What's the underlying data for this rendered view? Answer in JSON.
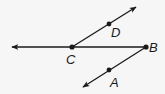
{
  "diagram": {
    "type": "geometry-rays",
    "stroke_color": "#1a1a1a",
    "background": "#f6f6f6",
    "points": [
      {
        "name": "C",
        "label": "C",
        "x": 72,
        "y": 47,
        "label_x": 66,
        "label_y": 64
      },
      {
        "name": "D",
        "label": "D",
        "x": 109,
        "y": 24,
        "label_x": 111,
        "label_y": 37
      },
      {
        "name": "B",
        "label": "B",
        "x": 146,
        "y": 47,
        "label_x": 149,
        "label_y": 52
      },
      {
        "name": "A",
        "label": "A",
        "x": 109,
        "y": 70,
        "label_x": 110,
        "label_y": 87
      }
    ],
    "rays": [
      {
        "name": "ray-BC",
        "from": "B",
        "through": "C",
        "end_x": 10,
        "end_y": 47
      },
      {
        "name": "ray-CD",
        "from": "C",
        "through": "D",
        "end_x": 137,
        "end_y": 6
      },
      {
        "name": "ray-BA",
        "from": "B",
        "through": "A",
        "end_x": 82,
        "end_y": 88
      }
    ]
  }
}
